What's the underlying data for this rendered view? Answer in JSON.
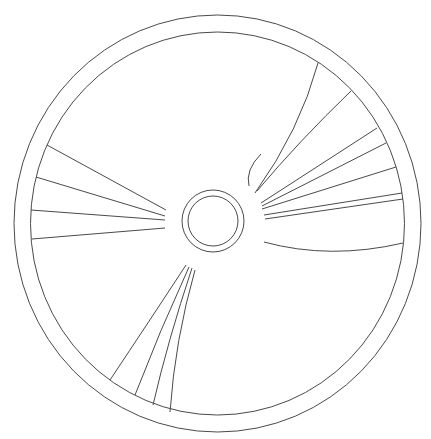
{
  "diagram": {
    "line_color": "#4a4a4a",
    "background": "#ffffff",
    "rim": {
      "cx": 217.5,
      "cy": 223.5,
      "outer_rx": 203.5,
      "outer_ry": 208.5,
      "inner_rx": 187,
      "inner_ry": 191.5
    },
    "hub": {
      "cx": 213,
      "cy": 221,
      "outer_r": 31,
      "inner_r": 25
    },
    "spoke_groups": [
      {
        "name": "upper-right",
        "count": 8
      },
      {
        "name": "left",
        "count": 4
      },
      {
        "name": "lower-left",
        "count": 4
      }
    ]
  }
}
